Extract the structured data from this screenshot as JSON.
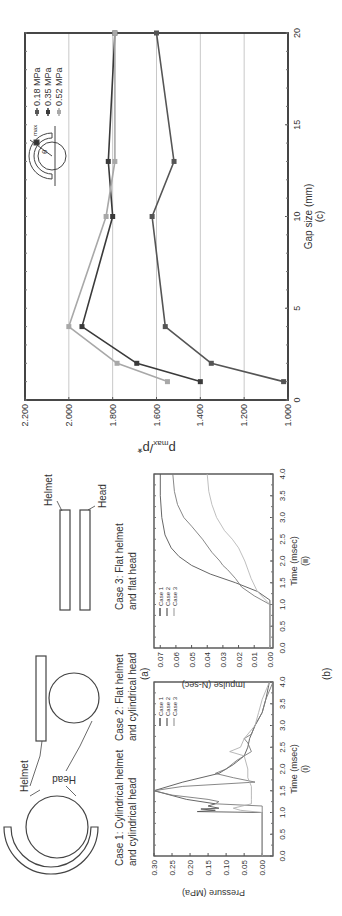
{
  "panel_labels": {
    "a": "(a)",
    "b": "(b)",
    "c": "(c)"
  },
  "diagrams": {
    "helmet_label": "Helmet",
    "head_label": "Head",
    "case1": [
      "Case 1: Cylindrical helmet",
      "and cylindrical head"
    ],
    "case2": [
      "Case 2: Flat helmet",
      "and cylindrical head"
    ],
    "case3": [
      "Case 3: Flat helmet",
      "and flat head"
    ]
  },
  "chart_data": [
    {
      "id": "b-i",
      "type": "line",
      "title": "",
      "sublabel": "(i)",
      "xlabel": "Time (msec)",
      "ylabel": "Pressure (MPa)",
      "xlim": [
        0,
        4.0
      ],
      "ylim": [
        -0.03,
        0.3
      ],
      "xticks": [
        "0.0",
        "0.5",
        "1.0",
        "1.5",
        "2.0",
        "2.5",
        "3.0",
        "3.5",
        "4.0"
      ],
      "yticks": [
        "0.00",
        "0.05",
        "0.10",
        "0.15",
        "0.20",
        "0.25",
        "0.30"
      ],
      "legend": [
        "Case 1",
        "Case 2",
        "Case 3"
      ],
      "series": [
        {
          "name": "Case 1",
          "color": "#555555",
          "x": [
            0,
            1.0,
            1.02,
            1.05,
            1.08,
            1.1,
            1.15,
            1.2,
            1.3,
            1.5,
            1.7,
            1.9,
            2.1,
            2.3,
            2.5,
            2.7,
            3.0,
            3.3,
            3.6,
            4.0
          ],
          "y": [
            0,
            0,
            0.18,
            0.13,
            0.17,
            0.12,
            0.15,
            0.13,
            0.21,
            0.3,
            0.22,
            0.12,
            0.08,
            0.05,
            0.04,
            0.035,
            0.02,
            0.0,
            -0.01,
            -0.02
          ]
        },
        {
          "name": "Case 2",
          "color": "#7a7a7a",
          "x": [
            0,
            1.15,
            1.2,
            1.25,
            1.3,
            1.4,
            1.5,
            1.6,
            1.7,
            1.8,
            1.9,
            2.0,
            2.2,
            2.4,
            2.6,
            2.7,
            2.8,
            3.0,
            3.3,
            3.6,
            4.0
          ],
          "y": [
            0,
            0,
            0.13,
            0.12,
            0.15,
            0.25,
            0.3,
            0.22,
            0.02,
            0.08,
            0.13,
            0.1,
            0.07,
            0.03,
            0.04,
            0.05,
            0.03,
            0.02,
            0.0,
            -0.01,
            -0.03
          ]
        },
        {
          "name": "Case 3",
          "color": "#b0b0b0",
          "x": [
            0,
            1.0,
            1.05,
            1.1,
            1.2,
            1.3,
            1.4,
            1.6,
            1.8,
            2.0,
            2.3,
            2.4,
            2.5,
            2.7,
            3.0,
            3.3,
            3.6,
            4.0
          ],
          "y": [
            0,
            0,
            0.06,
            0.08,
            0.03,
            0.03,
            0.03,
            0.03,
            0.04,
            0.04,
            0.05,
            0.09,
            0.06,
            0.05,
            0.02,
            0.01,
            0.0,
            -0.02
          ]
        }
      ]
    },
    {
      "id": "b-ii",
      "type": "line",
      "title": "",
      "sublabel": "(ii)",
      "xlabel": "Time (msec)",
      "ylabel": "Impulse (N-sec)",
      "xlim": [
        0,
        4.0
      ],
      "ylim": [
        -0.002,
        0.074
      ],
      "xticks": [
        "0.0",
        "0.5",
        "1.0",
        "1.5",
        "2.0",
        "2.5",
        "3.0",
        "3.5",
        "4.0"
      ],
      "yticks": [
        "0.00",
        "0.01",
        "0.02",
        "0.03",
        "0.04",
        "0.05",
        "0.06",
        "0.07"
      ],
      "legend": [
        "Case 1",
        "Case 2",
        "Case 3"
      ],
      "series": [
        {
          "name": "Case 1",
          "color": "#555555",
          "x": [
            0,
            1.1,
            1.3,
            1.5,
            1.7,
            1.9,
            2.1,
            2.3,
            2.6,
            3.0,
            3.5,
            4.0
          ],
          "y": [
            0,
            0,
            0.008,
            0.022,
            0.038,
            0.05,
            0.058,
            0.063,
            0.067,
            0.069,
            0.07,
            0.07
          ]
        },
        {
          "name": "Case 2",
          "color": "#7a7a7a",
          "x": [
            0,
            1.0,
            1.2,
            1.4,
            1.6,
            1.8,
            1.9,
            2.0,
            2.2,
            2.5,
            2.8,
            3.0,
            3.3,
            3.6,
            4.0
          ],
          "y": [
            0,
            0,
            0.01,
            0.018,
            0.022,
            0.027,
            0.03,
            0.032,
            0.037,
            0.043,
            0.05,
            0.055,
            0.059,
            0.061,
            0.062
          ]
        },
        {
          "name": "Case 3",
          "color": "#b8b8b8",
          "x": [
            0,
            1.0,
            1.3,
            1.6,
            2.0,
            2.3,
            2.5,
            2.7,
            3.0,
            3.3,
            3.6,
            4.0
          ],
          "y": [
            0,
            0,
            0.008,
            0.012,
            0.016,
            0.02,
            0.024,
            0.029,
            0.034,
            0.037,
            0.039,
            0.04
          ]
        }
      ]
    },
    {
      "id": "c",
      "type": "line",
      "title": "",
      "sublabel": "(c)",
      "xlabel": "Gap size (mm)",
      "ylabel": "p_max/p*",
      "xlim": [
        0,
        20
      ],
      "ylim": [
        1.0,
        2.2
      ],
      "xticks": [
        "0",
        "5",
        "10",
        "15",
        "20"
      ],
      "yticks": [
        "1.000",
        "1.200",
        "1.400",
        "1.600",
        "1.800",
        "2.000",
        "2.200"
      ],
      "grid": true,
      "legend_position": "upper-right",
      "legend": [
        "0.18 MPa",
        "0.35 MPa",
        "0.52 MPa"
      ],
      "inset_labels": {
        "theta": "θ",
        "pmax": "p_max"
      },
      "series": [
        {
          "name": "0.18 MPa",
          "color": "#555555",
          "x": [
            1,
            2,
            4,
            10,
            13,
            20
          ],
          "y": [
            1.02,
            1.35,
            1.56,
            1.62,
            1.52,
            1.6
          ]
        },
        {
          "name": "0.35 MPa",
          "color": "#3a3a3a",
          "x": [
            1,
            2,
            4,
            10,
            13,
            20
          ],
          "y": [
            1.4,
            1.69,
            1.94,
            1.8,
            1.82,
            1.79
          ]
        },
        {
          "name": "0.52 MPa",
          "color": "#a8a8a8",
          "x": [
            1,
            2,
            4,
            10,
            13,
            20
          ],
          "y": [
            1.55,
            1.78,
            2.0,
            1.83,
            1.79,
            1.79
          ]
        }
      ]
    }
  ]
}
